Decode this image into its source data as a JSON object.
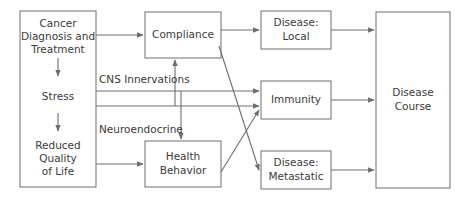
{
  "diagram": {
    "colors": {
      "background": "#ffffff",
      "box_stroke": "#6e6e6e",
      "edge_stroke": "#6e6e6e",
      "text": "#3a3a3a"
    },
    "nodes": [
      {
        "id": "cancer-diagnosis-and-treatment",
        "lines": [
          "Cancer",
          "Diagnosis and",
          "Treatment"
        ],
        "line1": "Cancer",
        "line2": "Diagnosis and",
        "line3": "Treatment"
      },
      {
        "id": "stress",
        "lines": [
          "Stress"
        ],
        "line1": "Stress"
      },
      {
        "id": "reduced-quality-of-life",
        "lines": [
          "Reduced",
          "Quality",
          "of Life"
        ],
        "line1": "Reduced",
        "line2": "Quality",
        "line3": "of Life"
      },
      {
        "id": "compliance",
        "lines": [
          "Compliance"
        ],
        "line1": "Compliance"
      },
      {
        "id": "health-behavior",
        "lines": [
          "Health",
          "Behavior"
        ],
        "line1": "Health",
        "line2": "Behavior"
      },
      {
        "id": "disease-local",
        "lines": [
          "Disease:",
          "Local"
        ],
        "line1": "Disease:",
        "line2": "Local"
      },
      {
        "id": "immunity",
        "lines": [
          "Immunity"
        ],
        "line1": "Immunity"
      },
      {
        "id": "disease-metastatic",
        "lines": [
          "Disease:",
          "Metastatic"
        ],
        "line1": "Disease:",
        "line2": "Metastatic"
      },
      {
        "id": "disease-course",
        "lines": [
          "Disease",
          "Course"
        ],
        "line1": "Disease",
        "line2": "Course"
      }
    ],
    "edge_labels": {
      "cns": "CNS Innervations",
      "neuroendocrine": "Neuroendocrine"
    },
    "edges": [
      {
        "from": "cancer-diagnosis-and-treatment",
        "to": "stress",
        "type": "vertical-arrow"
      },
      {
        "from": "stress",
        "to": "reduced-quality-of-life",
        "type": "vertical-arrow"
      },
      {
        "from": "cancer-diagnosis-and-treatment",
        "to": "compliance",
        "type": "horizontal-arrow"
      },
      {
        "from": "reduced-quality-of-life",
        "to": "health-behavior",
        "type": "horizontal-arrow"
      },
      {
        "from": "left-group",
        "to": "immunity",
        "label": "CNS Innervations",
        "type": "horizontal-arrow"
      },
      {
        "from": "left-group",
        "to": "immunity",
        "label": "Neuroendocrine",
        "type": "horizontal-arrow"
      },
      {
        "from": "cns-line",
        "to": "health-behavior",
        "type": "vertical-arrow-down"
      },
      {
        "from": "neuroendocrine-line",
        "to": "compliance",
        "type": "vertical-arrow-up"
      },
      {
        "from": "compliance",
        "to": "disease-local",
        "type": "horizontal-arrow"
      },
      {
        "from": "compliance",
        "to": "disease-metastatic",
        "type": "diagonal-arrow"
      },
      {
        "from": "health-behavior",
        "to": "immunity",
        "type": "diagonal-arrow"
      },
      {
        "from": "disease-local",
        "to": "disease-course",
        "type": "horizontal-arrow"
      },
      {
        "from": "immunity",
        "to": "disease-course",
        "type": "horizontal-arrow"
      },
      {
        "from": "disease-metastatic",
        "to": "disease-course",
        "type": "horizontal-arrow"
      }
    ]
  }
}
